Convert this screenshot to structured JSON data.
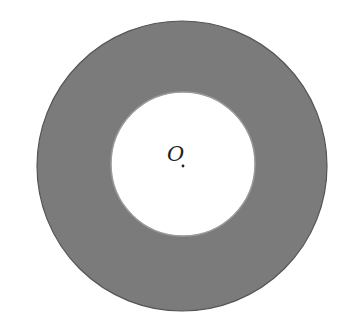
{
  "diagram": {
    "type": "annulus",
    "center_label": "O",
    "colors": {
      "background": "#ffffff",
      "ring_fill": "#7b7b7b",
      "outer_stroke": "#555555",
      "inner_fill": "#ffffff",
      "inner_stroke": "#9a9a9a",
      "center_dot": "#222222"
    },
    "outer_circle": {
      "cx": 182,
      "cy": 166,
      "r": 145
    },
    "inner_circle": {
      "cx": 183,
      "cy": 164,
      "r": 72
    },
    "center_point": {
      "x": 183,
      "y": 166
    }
  }
}
